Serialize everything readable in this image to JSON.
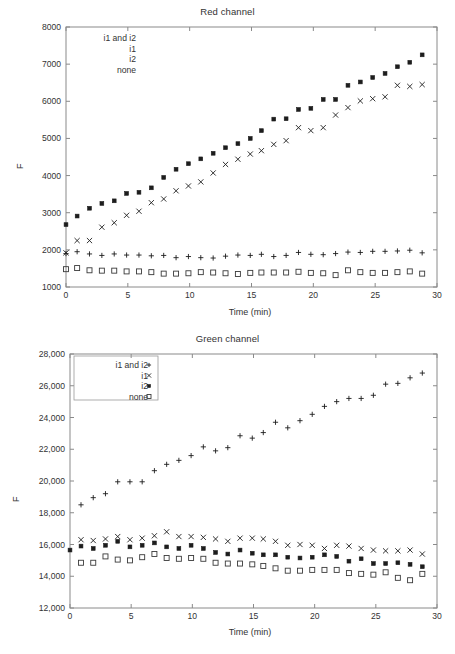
{
  "figure": {
    "panels": [
      "red",
      "green"
    ]
  },
  "red": {
    "title": "Red channel",
    "xlabel": "Time (min)",
    "ylabel": "F",
    "legend_items": [
      {
        "label": "i1 and i2",
        "marker": "plus-marker"
      },
      {
        "label": "i1",
        "marker": "cross-marker"
      },
      {
        "label": "i2",
        "marker": "filled-square-marker"
      },
      {
        "label": "none",
        "marker": "open-square-marker"
      }
    ],
    "legend_markers_visible": false,
    "xticks": [
      "0",
      "5",
      "10",
      "15",
      "20",
      "25",
      "30"
    ],
    "yticks": [
      "1000",
      "2000",
      "3000",
      "4000",
      "5000",
      "6000",
      "7000",
      "8000"
    ]
  },
  "green": {
    "title": "Green channel",
    "xlabel": "Time (min)",
    "ylabel": "F",
    "legend_items": [
      {
        "label": "i1 and i2",
        "marker": "plus-marker"
      },
      {
        "label": "i1",
        "marker": "cross-marker"
      },
      {
        "label": "i2",
        "marker": "filled-square-marker"
      },
      {
        "label": "none",
        "marker": "open-square-marker"
      }
    ],
    "legend_markers_visible": true,
    "xticks": [
      "0",
      "5",
      "10",
      "15",
      "20",
      "25",
      "30"
    ],
    "yticks": [
      "12,000",
      "14,000",
      "16,000",
      "18,000",
      "20,000",
      "22,000",
      "24,000",
      "26,000",
      "28,000"
    ]
  },
  "chart_data": [
    {
      "type": "scatter",
      "title": "Red channel",
      "xlabel": "Time (min)",
      "ylabel": "F",
      "xlim": [
        0,
        30
      ],
      "ylim": [
        1000,
        8000
      ],
      "xticks": [
        0,
        5,
        10,
        15,
        20,
        25,
        30
      ],
      "yticks": [
        1000,
        2000,
        3000,
        4000,
        5000,
        6000,
        7000,
        8000
      ],
      "grid": false,
      "legend_position": "upper-left",
      "series": [
        {
          "name": "i2",
          "marker": "filled-square",
          "color": "#1d1d1d",
          "x": [
            0,
            0.9,
            1.9,
            2.9,
            3.9,
            4.9,
            5.9,
            6.9,
            7.9,
            8.9,
            9.9,
            10.9,
            11.9,
            12.9,
            13.9,
            14.9,
            15.8,
            16.8,
            17.8,
            18.8,
            19.8,
            20.8,
            21.8,
            22.8,
            23.8,
            24.8,
            25.8,
            26.8,
            27.8,
            28.8
          ],
          "y": [
            2680,
            2910,
            3120,
            3250,
            3320,
            3520,
            3550,
            3670,
            3950,
            4170,
            4320,
            4450,
            4600,
            4750,
            4860,
            5000,
            5210,
            5520,
            5530,
            5780,
            5810,
            6050,
            6050,
            6430,
            6520,
            6640,
            6750,
            6930,
            7050,
            7250
          ]
        },
        {
          "name": "i1",
          "marker": "cross",
          "color": "#1d1d1d",
          "x": [
            0,
            0.9,
            1.9,
            2.9,
            3.9,
            4.9,
            5.9,
            6.9,
            7.9,
            8.9,
            9.9,
            10.9,
            11.9,
            12.9,
            13.9,
            14.9,
            15.8,
            16.8,
            17.8,
            18.8,
            19.8,
            20.8,
            21.8,
            22.8,
            23.8,
            24.8,
            25.8,
            26.8,
            27.8,
            28.8
          ],
          "y": [
            1920,
            2250,
            2250,
            2610,
            2730,
            2930,
            3040,
            3270,
            3370,
            3590,
            3720,
            3830,
            4070,
            4300,
            4440,
            4580,
            4670,
            4840,
            4940,
            5290,
            5210,
            5290,
            5630,
            5830,
            6010,
            6070,
            6120,
            6430,
            6400,
            6450
          ]
        },
        {
          "name": "i1 and i2",
          "marker": "plus",
          "color": "#1d1d1d",
          "x": [
            0,
            0.9,
            1.9,
            2.9,
            3.9,
            4.9,
            5.9,
            6.9,
            7.9,
            8.9,
            9.9,
            10.9,
            11.9,
            12.9,
            13.9,
            14.9,
            15.8,
            16.8,
            17.8,
            18.8,
            19.8,
            20.8,
            21.8,
            22.8,
            23.8,
            24.8,
            25.8,
            26.8,
            27.8,
            28.8
          ],
          "y": [
            1900,
            1950,
            1890,
            1850,
            1890,
            1860,
            1860,
            1840,
            1850,
            1790,
            1820,
            1790,
            1780,
            1830,
            1860,
            1850,
            1880,
            1820,
            1850,
            1930,
            1880,
            1870,
            1900,
            1940,
            1930,
            1960,
            1960,
            1970,
            1990,
            1920
          ]
        },
        {
          "name": "none",
          "marker": "open-square",
          "color": "#1d1d1d",
          "x": [
            0,
            0.9,
            1.9,
            2.9,
            3.9,
            4.9,
            5.9,
            6.9,
            7.9,
            8.9,
            9.9,
            10.9,
            11.9,
            12.9,
            13.9,
            14.9,
            15.8,
            16.8,
            17.8,
            18.8,
            19.8,
            20.8,
            21.8,
            22.8,
            23.8,
            24.8,
            25.8,
            26.8,
            27.8,
            28.8
          ],
          "y": [
            1480,
            1510,
            1450,
            1440,
            1440,
            1420,
            1420,
            1400,
            1360,
            1360,
            1370,
            1400,
            1390,
            1370,
            1350,
            1380,
            1390,
            1390,
            1390,
            1410,
            1380,
            1370,
            1320,
            1450,
            1400,
            1380,
            1380,
            1400,
            1420,
            1360
          ]
        }
      ]
    },
    {
      "type": "scatter",
      "title": "Green channel",
      "xlabel": "Time (min)",
      "ylabel": "F",
      "xlim": [
        0,
        30
      ],
      "ylim": [
        12000,
        28000
      ],
      "xticks": [
        0,
        5,
        10,
        15,
        20,
        25,
        30
      ],
      "yticks": [
        12000,
        14000,
        16000,
        18000,
        20000,
        22000,
        24000,
        26000,
        28000
      ],
      "grid": false,
      "legend_position": "upper-left",
      "series": [
        {
          "name": "i1 and i2",
          "marker": "plus",
          "color": "#1d1d1d",
          "x": [
            0.9,
            1.9,
            2.9,
            3.9,
            4.9,
            5.9,
            6.9,
            7.9,
            8.9,
            9.9,
            10.9,
            11.9,
            12.9,
            13.9,
            14.9,
            15.8,
            16.8,
            17.8,
            18.8,
            19.8,
            20.8,
            21.8,
            22.8,
            23.8,
            24.8,
            25.8,
            26.8,
            27.8,
            28.8
          ],
          "y": [
            18500,
            18950,
            19200,
            19950,
            19950,
            19950,
            20650,
            21050,
            21300,
            21600,
            22150,
            21900,
            22100,
            22850,
            22700,
            23050,
            23700,
            23350,
            23800,
            24200,
            24700,
            25000,
            25200,
            25200,
            25400,
            26100,
            26150,
            26500,
            26800
          ]
        },
        {
          "name": "i1",
          "marker": "cross",
          "color": "#1d1d1d",
          "x": [
            0.9,
            1.9,
            2.9,
            3.9,
            4.9,
            5.9,
            6.9,
            7.9,
            8.9,
            9.9,
            10.9,
            11.9,
            12.9,
            13.9,
            14.9,
            15.8,
            16.8,
            17.8,
            18.8,
            19.8,
            20.8,
            21.8,
            22.8,
            23.8,
            24.8,
            25.8,
            26.8,
            27.8,
            28.8
          ],
          "y": [
            16300,
            16250,
            16350,
            16500,
            16300,
            16400,
            16550,
            16800,
            16500,
            16500,
            16450,
            16350,
            16200,
            16400,
            16400,
            16350,
            16200,
            15950,
            16000,
            15950,
            15750,
            15950,
            15900,
            15750,
            15650,
            15600,
            15600,
            15650,
            15400
          ]
        },
        {
          "name": "i2",
          "marker": "filled-square",
          "color": "#1d1d1d",
          "x": [
            0,
            0.9,
            1.9,
            2.9,
            3.9,
            4.9,
            5.9,
            6.9,
            7.9,
            8.9,
            9.9,
            10.9,
            11.9,
            12.9,
            13.9,
            14.9,
            15.8,
            16.8,
            17.8,
            18.8,
            19.8,
            20.8,
            21.8,
            22.8,
            23.8,
            24.8,
            25.8,
            26.8,
            27.8,
            28.8
          ],
          "y": [
            15650,
            15900,
            15750,
            15950,
            16200,
            15850,
            15950,
            16100,
            15850,
            15750,
            15950,
            15750,
            15500,
            15400,
            15650,
            15450,
            15350,
            15350,
            15200,
            15150,
            15200,
            15350,
            15250,
            14950,
            15100,
            14800,
            14800,
            14850,
            14750,
            14600
          ]
        },
        {
          "name": "none",
          "marker": "open-square",
          "color": "#1d1d1d",
          "x": [
            0.9,
            1.9,
            2.9,
            3.9,
            4.9,
            5.9,
            6.9,
            7.9,
            8.9,
            9.9,
            10.9,
            11.9,
            12.9,
            13.9,
            14.9,
            15.8,
            16.8,
            17.8,
            18.8,
            19.8,
            20.8,
            21.8,
            22.8,
            23.8,
            24.8,
            25.8,
            26.8,
            27.8,
            28.8
          ],
          "y": [
            14850,
            14850,
            15250,
            15050,
            15000,
            15200,
            15400,
            15150,
            15100,
            15150,
            15100,
            14850,
            14800,
            14800,
            14750,
            14650,
            14500,
            14350,
            14350,
            14400,
            14400,
            14400,
            14200,
            14150,
            14100,
            14250,
            13900,
            13750,
            14150
          ]
        }
      ]
    }
  ]
}
